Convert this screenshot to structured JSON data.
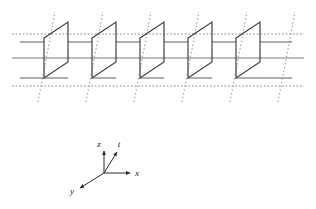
{
  "figure": {
    "title": "",
    "background_color": "#ffffff",
    "width": 316,
    "height": 209
  },
  "colors": {
    "plane_edge": "#3a3a3a",
    "solid_grid_line": "#7a7a7a",
    "dotted_grid_line": "#8a8a8a",
    "depth_line": "#9a9a9a",
    "axis_line": "#2b2b2b",
    "axis_text": "#1a1a1a"
  },
  "planes": {
    "count": 5,
    "label": "constant-x plane",
    "geometry": {
      "left_edge_top_y": 38,
      "left_edge_bottom_y": 78,
      "right_edge_top_y": 22,
      "right_edge_bottom_y": 62,
      "width": 24,
      "spacing": 48,
      "first_left_x": 44
    }
  },
  "grid": {
    "solid_horizontal_rows": [
      58
    ],
    "dotted_horizontal_rows": [
      34,
      86
    ],
    "depth_lines_label": "t-direction lattice lines",
    "depth_line_count": 6,
    "solid_line_count": 1,
    "dotted_line_count": 2
  },
  "axis_key": {
    "name": "coordinate-axis-key",
    "origin": {
      "x": 104,
      "y": 173
    },
    "axes": [
      {
        "id": "z",
        "label": "z",
        "dx": 0,
        "dy": -24,
        "label_x": 100,
        "label_y": 146,
        "style": "solid"
      },
      {
        "id": "t",
        "label": "t",
        "dx": 14,
        "dy": -24,
        "label_x": 119,
        "label_y": 146,
        "style": "solid"
      },
      {
        "id": "x",
        "label": "x",
        "dx": 28,
        "dy": 0,
        "label_x": 137,
        "label_y": 176,
        "style": "solid"
      },
      {
        "id": "y",
        "label": "y",
        "dx": -26,
        "dy": 16,
        "label_x": 72,
        "label_y": 193,
        "style": "solid"
      }
    ]
  }
}
